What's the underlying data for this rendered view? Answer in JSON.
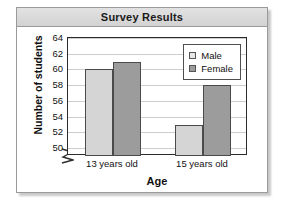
{
  "card": {
    "title": "Survey Results"
  },
  "chart_data": {
    "type": "bar",
    "title": "Survey Results",
    "xlabel": "Age",
    "ylabel": "Number of students",
    "categories": [
      "13 years old",
      "15 years old"
    ],
    "series": [
      {
        "name": "Male",
        "values": [
          60,
          53
        ],
        "color": "#d5d5d5"
      },
      {
        "name": "Female",
        "values": [
          61,
          58
        ],
        "color": "#9c9c9c"
      }
    ],
    "ylim": [
      49,
      64
    ],
    "yticks": [
      50,
      52,
      54,
      56,
      58,
      60,
      62,
      64
    ],
    "grid": true,
    "axis_break": true,
    "legend_position": "top-right"
  }
}
